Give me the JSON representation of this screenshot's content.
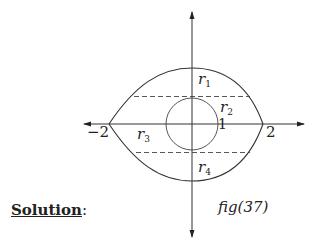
{
  "diagram": {
    "axes": {
      "x_ticks": [
        {
          "label": "−2",
          "value": -2
        },
        {
          "label": "1",
          "value": 1
        },
        {
          "label": "2",
          "value": 2
        }
      ]
    },
    "regions": [
      {
        "name": "r",
        "sub": "1"
      },
      {
        "name": "r",
        "sub": "2"
      },
      {
        "name": "r",
        "sub": "3"
      },
      {
        "name": "r",
        "sub": "4"
      }
    ],
    "circle_radius": 1,
    "cusps": [
      -2,
      2
    ],
    "figure_caption": "fig(37)"
  },
  "text": {
    "solution_label": "Solution",
    "solution_colon": ":"
  }
}
